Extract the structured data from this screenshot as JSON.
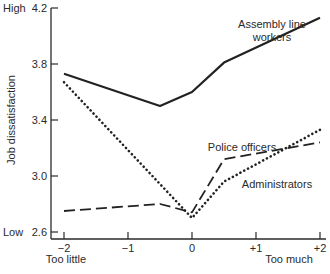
{
  "chart_data": {
    "type": "line",
    "title": "",
    "xlabel": "",
    "ylabel": "Job dissatisfaction",
    "xlim": [
      -2,
      2
    ],
    "ylim": [
      2.6,
      4.2
    ],
    "x_ticks": [
      {
        "value": -2,
        "label": "−2"
      },
      {
        "value": -1,
        "label": "−1"
      },
      {
        "value": 0,
        "label": "0"
      },
      {
        "value": 1,
        "label": "+1"
      },
      {
        "value": 2,
        "label": "+2"
      }
    ],
    "y_ticks": [
      {
        "value": 4.2,
        "label": "4.2"
      },
      {
        "value": 3.8,
        "label": "3.8"
      },
      {
        "value": 3.4,
        "label": "3.4"
      },
      {
        "value": 3.0,
        "label": "3.0"
      },
      {
        "value": 2.6,
        "label": "2.6"
      }
    ],
    "y_end_labels": {
      "high": "High",
      "low": "Low"
    },
    "x_end_labels": {
      "left": "Too little",
      "right": "Too much"
    },
    "grid": false,
    "legend": "inline labels next to lines",
    "series": [
      {
        "name": "Assembly line workers",
        "label_lines": [
          "Assembly line",
          "workers"
        ],
        "style": "solid",
        "x": [
          -2,
          -0.5,
          0,
          0.5,
          2
        ],
        "values": [
          3.73,
          3.5,
          3.6,
          3.81,
          4.13
        ]
      },
      {
        "name": "Police officers",
        "label_lines": [
          "Police officers"
        ],
        "style": "dashed",
        "x": [
          -2,
          -0.5,
          0,
          0.5,
          2
        ],
        "values": [
          2.75,
          2.8,
          2.74,
          3.12,
          3.24
        ]
      },
      {
        "name": "Administrators",
        "label_lines": [
          "Administrators"
        ],
        "style": "dotted",
        "x": [
          -2,
          0,
          0.5,
          2
        ],
        "values": [
          3.67,
          2.7,
          2.96,
          3.33
        ]
      }
    ]
  }
}
